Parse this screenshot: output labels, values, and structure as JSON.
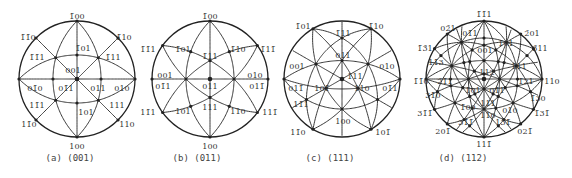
{
  "figure": {
    "stroke_color": "#222222",
    "label_color": "#333333",
    "background": "#ffffff",
    "panels": [
      {
        "id": "a",
        "caption": "(a) (001)",
        "projection_pole": [
          0,
          0,
          1
        ],
        "up": [
          -1,
          0,
          0
        ],
        "center": [
          77,
          79
        ],
        "radius": 58,
        "caption_x": 70,
        "labels": [
          {
            "text": "1̄00",
            "pos": [
              77,
              16
            ]
          },
          {
            "text": "1̄1̄0",
            "pos": [
              28,
              37
            ]
          },
          {
            "text": "1̄10",
            "pos": [
              124,
              37
            ]
          },
          {
            "text": "1̄01",
            "pos": [
              83,
              48
            ]
          },
          {
            "text": "1̄1̄1",
            "pos": [
              37,
              57
            ]
          },
          {
            "text": "1̄11",
            "pos": [
              113,
              57
            ]
          },
          {
            "text": "001",
            "pos": [
              73,
              70
            ]
          },
          {
            "text": "01̄0",
            "pos": [
              35,
              88
            ]
          },
          {
            "text": "01̄1",
            "pos": [
              66,
              88
            ]
          },
          {
            "text": "011",
            "pos": [
              98,
              88
            ]
          },
          {
            "text": "010",
            "pos": [
              122,
              88
            ]
          },
          {
            "text": "11̄1",
            "pos": [
              37,
              105
            ]
          },
          {
            "text": "111",
            "pos": [
              117,
              105
            ]
          },
          {
            "text": "101",
            "pos": [
              86,
              112
            ]
          },
          {
            "text": "11̄0",
            "pos": [
              29,
              124
            ]
          },
          {
            "text": "110",
            "pos": [
              127,
              124
            ]
          },
          {
            "text": "100",
            "pos": [
              77,
              146
            ]
          }
        ]
      },
      {
        "id": "b",
        "caption": "(b) (011)",
        "projection_pole": [
          0,
          1,
          1
        ],
        "up": [
          -1,
          0,
          0
        ],
        "center": [
          210,
          79
        ],
        "radius": 58,
        "caption_x": 197,
        "labels": [
          {
            "text": "1̄00",
            "pos": [
              210,
              16
            ]
          },
          {
            "text": "1̄1̄1",
            "pos": [
              148,
              49
            ]
          },
          {
            "text": "1̄01",
            "pos": [
              183,
              49
            ]
          },
          {
            "text": "1̄11",
            "pos": [
              210,
              56
            ]
          },
          {
            "text": "1̄10",
            "pos": [
              238,
              49
            ]
          },
          {
            "text": "1̄11̄",
            "pos": [
              268,
              49
            ]
          },
          {
            "text": "001",
            "pos": [
              165,
              75
            ]
          },
          {
            "text": "01̄1",
            "pos": [
              163,
              86
            ]
          },
          {
            "text": "011",
            "pos": [
              210,
              86
            ]
          },
          {
            "text": "010",
            "pos": [
              255,
              75
            ]
          },
          {
            "text": "011̄",
            "pos": [
              257,
              86
            ]
          },
          {
            "text": "111",
            "pos": [
              210,
              107
            ]
          },
          {
            "text": "11̄1",
            "pos": [
              148,
              112
            ]
          },
          {
            "text": "101",
            "pos": [
              183,
              111
            ]
          },
          {
            "text": "110",
            "pos": [
              238,
              111
            ]
          },
          {
            "text": "111̄",
            "pos": [
              270,
              112
            ]
          },
          {
            "text": "100",
            "pos": [
              210,
              146
            ]
          }
        ]
      },
      {
        "id": "c",
        "caption": "(c) (111)",
        "projection_pole": [
          1,
          1,
          1
        ],
        "up": [
          -1,
          1,
          1
        ],
        "center": [
          342,
          79
        ],
        "radius": 58,
        "caption_x": 330,
        "labels": [
          {
            "text": "1̄01",
            "pos": [
              303,
              26
            ]
          },
          {
            "text": "1̄10",
            "pos": [
              376,
              26
            ]
          },
          {
            "text": "1̄11",
            "pos": [
              343,
              33
            ]
          },
          {
            "text": "011",
            "pos": [
              343,
              55
            ]
          },
          {
            "text": "001",
            "pos": [
              297,
              66
            ]
          },
          {
            "text": "010",
            "pos": [
              387,
              66
            ]
          },
          {
            "text": "111",
            "pos": [
              355,
              76
            ]
          },
          {
            "text": "011̄",
            "pos": [
              296,
              88
            ]
          },
          {
            "text": "101̄",
            "pos": [
              322,
              88
            ]
          },
          {
            "text": "110",
            "pos": [
              362,
              88
            ]
          },
          {
            "text": "01̄1",
            "pos": [
              390,
              88
            ]
          },
          {
            "text": "11̄1",
            "pos": [
              301,
              104
            ]
          },
          {
            "text": "100",
            "pos": [
              343,
              121
            ]
          },
          {
            "text": "11̄0",
            "pos": [
              298,
              132
            ]
          },
          {
            "text": "101̄",
            "pos": [
              383,
              132
            ]
          }
        ]
      },
      {
        "id": "d",
        "caption": "(d) (112)",
        "projection_pole": [
          1,
          1,
          2
        ],
        "up": [
          -1,
          -1,
          1
        ],
        "center": [
          484,
          79
        ],
        "radius": 58,
        "caption_x": 463,
        "labels": [
          {
            "text": "1̄1̄1",
            "pos": [
              484,
              14
            ]
          },
          {
            "text": "02̄1",
            "pos": [
              448,
              28
            ]
          },
          {
            "text": "01̄1",
            "pos": [
              470,
              33
            ]
          },
          {
            "text": "2̄01",
            "pos": [
              532,
              33
            ]
          },
          {
            "text": "1̄01",
            "pos": [
              506,
              43
            ]
          },
          {
            "text": "1̄3̄1",
            "pos": [
              425,
              48
            ]
          },
          {
            "text": "3̄11",
            "pos": [
              540,
              48
            ]
          },
          {
            "text": "001",
            "pos": [
              485,
              50
            ]
          },
          {
            "text": "11̄3",
            "pos": [
              436,
              62
            ]
          },
          {
            "text": "1̄11",
            "pos": [
              519,
              66
            ]
          },
          {
            "text": "112",
            "pos": [
              487,
              72
            ]
          },
          {
            "text": "1̄1̄0",
            "pos": [
              421,
              81
            ]
          },
          {
            "text": "2̄1̄1",
            "pos": [
              445,
              81
            ]
          },
          {
            "text": "1̄21",
            "pos": [
              526,
              81
            ]
          },
          {
            "text": "110",
            "pos": [
              552,
              81
            ]
          },
          {
            "text": "1̄01",
            "pos": [
              473,
              90
            ]
          },
          {
            "text": "01̄1",
            "pos": [
              497,
              90
            ]
          },
          {
            "text": "31̄0",
            "pos": [
              433,
              95
            ]
          },
          {
            "text": "1̄30",
            "pos": [
              538,
              98
            ]
          },
          {
            "text": "111",
            "pos": [
              488,
              103
            ]
          },
          {
            "text": "1̄00",
            "pos": [
              468,
              107
            ]
          },
          {
            "text": "010",
            "pos": [
              510,
              110
            ]
          },
          {
            "text": "31̄1̄",
            "pos": [
              425,
              113
            ]
          },
          {
            "text": "1̄31̄",
            "pos": [
              542,
              113
            ]
          },
          {
            "text": "110",
            "pos": [
              488,
              115
            ]
          },
          {
            "text": "31̄1̄",
            "pos": [
              466,
              122
            ]
          },
          {
            "text": "13̄1̄",
            "pos": [
              503,
              122
            ]
          },
          {
            "text": "201̄",
            "pos": [
              443,
              131
            ]
          },
          {
            "text": "021̄",
            "pos": [
              525,
              131
            ]
          },
          {
            "text": "111̄",
            "pos": [
              484,
              144
            ]
          }
        ]
      }
    ]
  }
}
